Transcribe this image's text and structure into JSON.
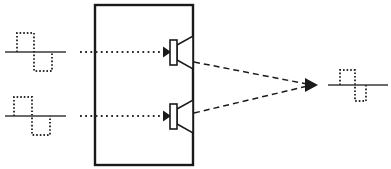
{
  "figure": {
    "type": "acoustic-signal-flow-diagram",
    "title": "",
    "background_color": "#ffffff",
    "line_color": "#1a1a1a",
    "width": 391,
    "height": 169
  },
  "enclosure": {
    "label": "",
    "shape": "rectangle",
    "x": 95,
    "y": 5,
    "width": 98,
    "height": 160,
    "stroke_width": 2.4
  },
  "input_signals": [
    {
      "name": "upper-input-waveform",
      "label": "",
      "axis": {
        "x1": 5,
        "x2": 66,
        "y": 52
      },
      "waveform": {
        "description": "bipolar rectangular pulse, positive lobe then negative lobe",
        "style": "dotted",
        "points": "17,52 17,33 34,33 34,71 52,71 52,52"
      }
    },
    {
      "name": "lower-input-waveform",
      "label": "",
      "axis": {
        "x1": 5,
        "x2": 66,
        "y": 116
      },
      "waveform": {
        "description": "bipolar rectangular pulse, positive lobe then negative lobe, time shifted",
        "style": "dotted",
        "points": "14,116 14,97 32,97 32,135 50,135 50,116"
      }
    }
  ],
  "output_signal": {
    "name": "output-waveform",
    "label": "",
    "axis": {
      "x1": 328,
      "x2": 388,
      "y": 85
    },
    "waveform": {
      "description": "compressed bipolar rectangular pulse, narrower than inputs",
      "style": "dotted",
      "points": "340,85 340,70 355,70 355,101 366,101 366,85"
    }
  },
  "input_arrows": [
    {
      "name": "upper-input-arrow",
      "label": "",
      "style": "dotted",
      "x1": 80,
      "x2": 164,
      "y": 52,
      "arrowhead": "right"
    },
    {
      "name": "lower-input-arrow",
      "label": "",
      "style": "dotted",
      "x1": 80,
      "x2": 164,
      "y": 116,
      "arrowhead": "right"
    }
  ],
  "transducers": [
    {
      "name": "upper-loudspeaker",
      "label": "",
      "body": {
        "x": 170,
        "y": 40,
        "width": 7,
        "height": 25
      },
      "horn": "177,45 193,36 193,69 177,60",
      "mounted_on": "enclosure-right-edge"
    },
    {
      "name": "lower-loudspeaker",
      "label": "",
      "body": {
        "x": 170,
        "y": 104,
        "width": 7,
        "height": 25
      },
      "horn": "177,109 193,100 193,133 177,124",
      "mounted_on": "enclosure-right-edge"
    }
  ],
  "radiation_rays": [
    {
      "name": "upper-radiation-ray",
      "label": "",
      "style": "dashed",
      "x1": 194,
      "y1": 62,
      "x2": 312,
      "y2": 85
    },
    {
      "name": "lower-radiation-ray",
      "label": "",
      "style": "dashed",
      "x1": 194,
      "y1": 113,
      "x2": 312,
      "y2": 85
    }
  ],
  "convergence_point": {
    "name": "convergence-arrowhead",
    "label": "",
    "x": 316,
    "y": 85,
    "direction": "right"
  }
}
